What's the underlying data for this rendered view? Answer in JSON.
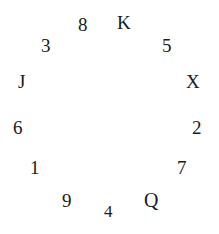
{
  "canvas": {
    "width": 219,
    "height": 234,
    "background_color": "#ffffff",
    "glyph_color": "#1a1a1a",
    "arrangement": "circular",
    "font_style": "serif"
  },
  "items": [
    {
      "label": "8",
      "x": 78,
      "y": 15,
      "size": 19,
      "kind": "digit"
    },
    {
      "label": "K",
      "x": 117,
      "y": 13,
      "size": 19,
      "kind": "letter"
    },
    {
      "label": "5",
      "x": 162,
      "y": 36,
      "size": 19,
      "kind": "digit"
    },
    {
      "label": "X",
      "x": 186,
      "y": 72,
      "size": 19,
      "kind": "letter"
    },
    {
      "label": "2",
      "x": 192,
      "y": 118,
      "size": 19,
      "kind": "digit"
    },
    {
      "label": "7",
      "x": 177,
      "y": 158,
      "size": 19,
      "kind": "digit"
    },
    {
      "label": "Q",
      "x": 144,
      "y": 190,
      "size": 20,
      "kind": "letter"
    },
    {
      "label": "4",
      "x": 104,
      "y": 203,
      "size": 17,
      "kind": "digit"
    },
    {
      "label": "9",
      "x": 62,
      "y": 191,
      "size": 19,
      "kind": "digit"
    },
    {
      "label": "1",
      "x": 30,
      "y": 158,
      "size": 19,
      "kind": "digit"
    },
    {
      "label": "6",
      "x": 13,
      "y": 118,
      "size": 19,
      "kind": "digit"
    },
    {
      "label": "J",
      "x": 18,
      "y": 72,
      "size": 19,
      "kind": "letter"
    },
    {
      "label": "3",
      "x": 41,
      "y": 36,
      "size": 19,
      "kind": "digit"
    }
  ]
}
